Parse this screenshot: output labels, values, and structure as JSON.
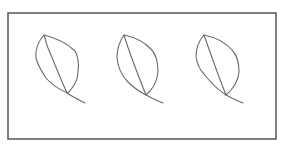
{
  "figure": {
    "frame": {
      "x": 8,
      "y": 13,
      "width": 268,
      "height": 126,
      "stroke": "#555555"
    },
    "stroke_color": "#6a6a6a",
    "leaves": [
      {
        "name": "leaf-1",
        "outline": "M44,35 C38,42 35,50 36,58 C38,66 42,72 46,78 C52,85 60,90 68,93 C72,88 78,82 78,72 C79,64 78,56 75,51 C68,44 56,38 44,35 Z",
        "midrib": "M44,35 C46,40 46,44 48,48 C54,62 60,78 67,93",
        "stem": "M67,93 C73,97 79,100 85,103"
      },
      {
        "name": "leaf-2",
        "outline": "M124,35 C119,42 117,50 117,58 C118,68 122,76 128,82 C134,88 140,92 146,95 C152,90 157,82 158,72 C158,62 156,54 151,49 C144,42 134,37 124,35 Z",
        "midrib": "M124,35 C130,55 138,75 146,95",
        "stem": "M146,95 C152,98 157,101 163,103"
      },
      {
        "name": "leaf-3",
        "outline": "M204,35 C198,42 196,50 196,56 C197,64 200,70 204,74 C211,83 218,90 226,95 C232,90 238,82 239,72 C239,62 237,55 232,50 C225,42 214,37 204,35 Z",
        "midrib": "M204,35 C211,55 218,75 226,95",
        "stem": "M226,95 C232,98 237,101 243,103"
      }
    ]
  }
}
